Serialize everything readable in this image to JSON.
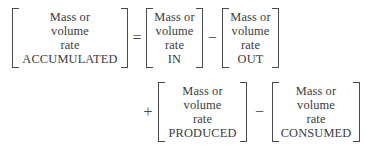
{
  "equation": {
    "label": "general-material-balance-equation",
    "text_color": "#3b3b3b",
    "bracket_color": "#4a4a4a",
    "background_color": "#ffffff",
    "rows": [
      {
        "id": "row-1",
        "items": [
          {
            "kind": "term",
            "name": "accumulated",
            "lines": [
              "Mass or",
              "volume",
              "rate",
              "ACCUMULATED"
            ]
          },
          {
            "kind": "operator",
            "name": "equals",
            "symbol": "="
          },
          {
            "kind": "term",
            "name": "in",
            "lines": [
              "Mass or",
              "volume",
              "rate",
              "IN"
            ]
          },
          {
            "kind": "operator",
            "name": "minus",
            "symbol": "−"
          },
          {
            "kind": "term",
            "name": "out",
            "lines": [
              "Mass or",
              "volume",
              "rate",
              "OUT"
            ]
          }
        ]
      },
      {
        "id": "row-2",
        "items": [
          {
            "kind": "operator",
            "name": "plus",
            "symbol": "+"
          },
          {
            "kind": "term",
            "name": "produced",
            "lines": [
              "Mass or",
              "volume",
              "rate",
              "PRODUCED"
            ]
          },
          {
            "kind": "operator",
            "name": "minus",
            "symbol": "−"
          },
          {
            "kind": "term",
            "name": "consumed",
            "lines": [
              "Mass or",
              "volume",
              "rate",
              "CONSUMED"
            ]
          }
        ]
      }
    ],
    "terms": {
      "accumulated": {
        "line1": "Mass or",
        "line2": "volume",
        "line3": "rate",
        "line4": "ACCUMULATED"
      },
      "in": {
        "line1": "Mass or",
        "line2": "volume",
        "line3": "rate",
        "line4": "IN"
      },
      "out": {
        "line1": "Mass or",
        "line2": "volume",
        "line3": "rate",
        "line4": "OUT"
      },
      "produced": {
        "line1": "Mass or",
        "line2": "volume",
        "line3": "rate",
        "line4": "PRODUCED"
      },
      "consumed": {
        "line1": "Mass or",
        "line2": "volume",
        "line3": "rate",
        "line4": "CONSUMED"
      }
    },
    "operators": {
      "equals": "=",
      "minus_1": "−",
      "plus": "+",
      "minus_2": "−"
    }
  }
}
